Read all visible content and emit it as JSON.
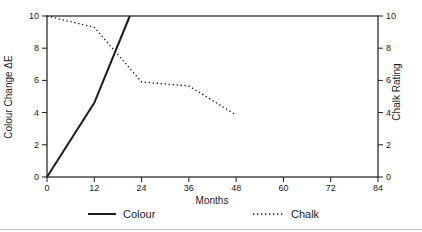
{
  "figure": {
    "background": "#ffffff",
    "ink_color": "#1c1c1c",
    "rule_color": "#bdbdbd"
  },
  "chart_data": {
    "type": "line",
    "title": "",
    "xlabel": "Months",
    "ylabel_left": "Colour Change ΔE",
    "ylabel_right": "Chalk Rating",
    "xlim": [
      0,
      84
    ],
    "ylim_left": [
      0,
      10
    ],
    "ylim_right": [
      0,
      10
    ],
    "x_ticks": [
      0,
      12,
      24,
      36,
      48,
      60,
      72,
      84
    ],
    "y_ticks_left": [
      0,
      2,
      4,
      6,
      8,
      10
    ],
    "y_ticks_right": [
      0,
      2,
      4,
      6,
      8,
      10
    ],
    "grid": false,
    "frame": "box",
    "legend_position": "bottom",
    "series": [
      {
        "name": "Colour",
        "axis": "left",
        "style": "solid",
        "points": [
          [
            0,
            0
          ],
          [
            12,
            4.6
          ],
          [
            21,
            10
          ]
        ]
      },
      {
        "name": "Chalk",
        "axis": "right",
        "style": "dotted",
        "points": [
          [
            0,
            10
          ],
          [
            12,
            9.3
          ],
          [
            24,
            5.9
          ],
          [
            36,
            5.65
          ],
          [
            48,
            3.85
          ]
        ]
      }
    ]
  },
  "legend": {
    "items": [
      {
        "label": "Colour",
        "style": "solid"
      },
      {
        "label": "Chalk",
        "style": "dotted"
      }
    ]
  }
}
